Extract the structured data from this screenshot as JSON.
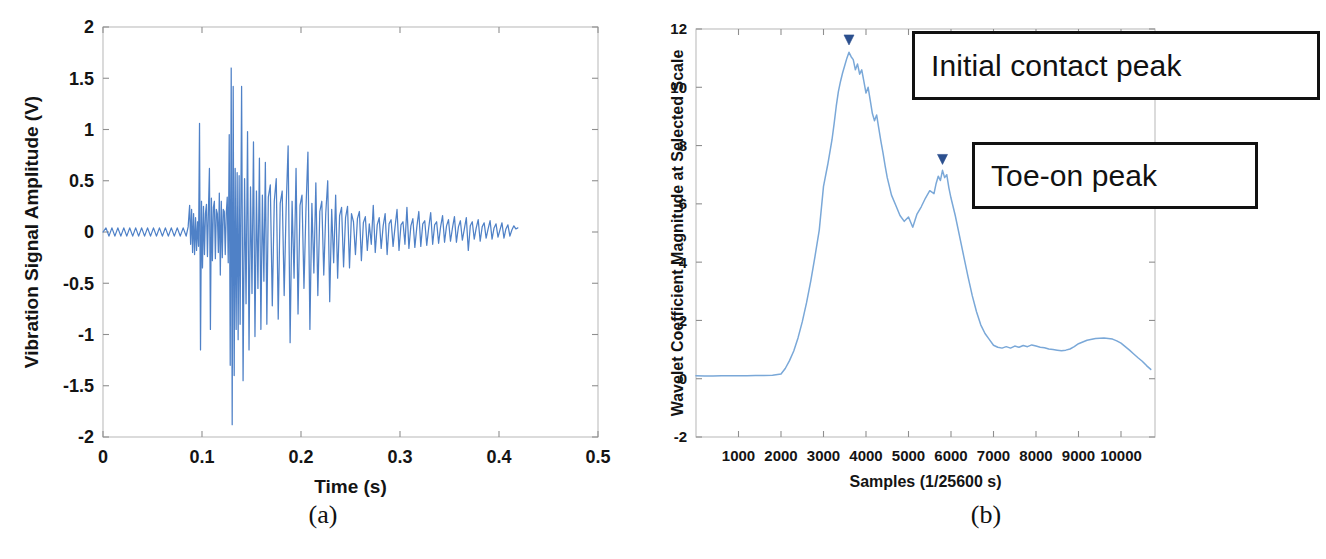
{
  "figure": {
    "panel_a_caption": "(a)",
    "panel_b_caption": "(b)"
  },
  "chart_data": [
    {
      "type": "line",
      "id": "vibration-signal",
      "title": "",
      "xlabel": "Time (s)",
      "ylabel": "Vibration Signal Amplitude (V)",
      "xlim": [
        0,
        0.5
      ],
      "ylim": [
        -2,
        2
      ],
      "xticks": [
        0,
        0.1,
        0.2,
        0.3,
        0.4,
        0.5
      ],
      "xticklabels": [
        "0",
        "0.1",
        "0.2",
        "0.3",
        "0.4",
        "0.5"
      ],
      "yticks": [
        -2,
        -1.5,
        -1,
        -0.5,
        0,
        0.5,
        1,
        1.5,
        2
      ],
      "yticklabels": [
        "-2",
        "-1.5",
        "-1",
        "-0.5",
        "0",
        "0.5",
        "1",
        "1.5",
        "2"
      ],
      "grid": false,
      "legend": null,
      "line_color": "#4f81c7",
      "x": [
        0.0,
        0.003,
        0.006,
        0.009,
        0.012,
        0.015,
        0.018,
        0.021,
        0.024,
        0.027,
        0.03,
        0.033,
        0.036,
        0.039,
        0.042,
        0.045,
        0.048,
        0.051,
        0.054,
        0.057,
        0.06,
        0.063,
        0.066,
        0.069,
        0.072,
        0.075,
        0.078,
        0.081,
        0.084,
        0.086,
        0.0875,
        0.0885,
        0.0895,
        0.0905,
        0.0915,
        0.0925,
        0.0935,
        0.0945,
        0.0955,
        0.0965,
        0.0975,
        0.0985,
        0.0995,
        0.1005,
        0.1015,
        0.1025,
        0.1035,
        0.1045,
        0.1055,
        0.1065,
        0.1075,
        0.1085,
        0.1095,
        0.1105,
        0.1115,
        0.1125,
        0.1135,
        0.1145,
        0.1155,
        0.1165,
        0.1175,
        0.1185,
        0.1195,
        0.1205,
        0.1215,
        0.1225,
        0.1235,
        0.1245,
        0.1255,
        0.1265,
        0.1275,
        0.1285,
        0.1295,
        0.1305,
        0.1315,
        0.1325,
        0.1335,
        0.1345,
        0.1355,
        0.1365,
        0.1375,
        0.1385,
        0.14,
        0.1415,
        0.143,
        0.1445,
        0.146,
        0.1475,
        0.149,
        0.1505,
        0.152,
        0.1535,
        0.155,
        0.1565,
        0.158,
        0.1595,
        0.161,
        0.1625,
        0.164,
        0.1655,
        0.167,
        0.169,
        0.171,
        0.173,
        0.175,
        0.177,
        0.179,
        0.181,
        0.183,
        0.185,
        0.187,
        0.189,
        0.191,
        0.193,
        0.195,
        0.197,
        0.199,
        0.201,
        0.203,
        0.205,
        0.207,
        0.209,
        0.211,
        0.213,
        0.215,
        0.217,
        0.219,
        0.221,
        0.223,
        0.225,
        0.227,
        0.229,
        0.231,
        0.233,
        0.235,
        0.237,
        0.239,
        0.241,
        0.243,
        0.245,
        0.247,
        0.249,
        0.251,
        0.253,
        0.255,
        0.257,
        0.259,
        0.261,
        0.263,
        0.265,
        0.267,
        0.269,
        0.271,
        0.273,
        0.275,
        0.277,
        0.279,
        0.281,
        0.283,
        0.285,
        0.287,
        0.289,
        0.291,
        0.293,
        0.295,
        0.297,
        0.299,
        0.301,
        0.303,
        0.305,
        0.307,
        0.309,
        0.311,
        0.313,
        0.315,
        0.317,
        0.319,
        0.321,
        0.323,
        0.325,
        0.327,
        0.329,
        0.331,
        0.333,
        0.335,
        0.337,
        0.339,
        0.341,
        0.343,
        0.345,
        0.347,
        0.349,
        0.351,
        0.353,
        0.355,
        0.357,
        0.359,
        0.361,
        0.363,
        0.365,
        0.367,
        0.369,
        0.371,
        0.373,
        0.375,
        0.377,
        0.379,
        0.381,
        0.383,
        0.385,
        0.387,
        0.389,
        0.391,
        0.393,
        0.395,
        0.397,
        0.399,
        0.401,
        0.403,
        0.405,
        0.407,
        0.409,
        0.411,
        0.413,
        0.415,
        0.417,
        0.419
      ],
      "y": [
        0.0,
        0.04,
        -0.04,
        0.04,
        -0.04,
        0.04,
        -0.04,
        0.04,
        -0.04,
        0.04,
        -0.04,
        0.04,
        -0.04,
        0.04,
        -0.04,
        0.04,
        -0.04,
        0.04,
        -0.04,
        0.04,
        -0.04,
        0.04,
        -0.04,
        0.04,
        -0.04,
        0.04,
        -0.04,
        0.04,
        -0.04,
        0.05,
        0.26,
        -0.12,
        0.22,
        -0.2,
        0.18,
        -0.22,
        0.14,
        -0.18,
        0.1,
        -0.14,
        1.06,
        -1.15,
        0.3,
        -0.35,
        0.25,
        -0.22,
        0.18,
        0.27,
        -0.24,
        0.21,
        0.62,
        -0.95,
        0.33,
        -0.28,
        0.24,
        0.3,
        -0.26,
        0.22,
        0.18,
        -0.2,
        0.38,
        -0.42,
        0.3,
        -0.25,
        0.22,
        0.2,
        -0.22,
        0.18,
        0.34,
        -0.3,
        0.95,
        -1.3,
        1.6,
        -1.88,
        1.42,
        -1.4,
        0.62,
        -0.95,
        0.58,
        -1.05,
        0.55,
        -0.9,
        1.42,
        -1.45,
        0.52,
        -0.7,
        0.98,
        -1.15,
        0.44,
        -0.6,
        0.88,
        -1.02,
        0.4,
        -0.55,
        0.72,
        -0.95,
        0.36,
        -0.48,
        0.68,
        -0.9,
        0.34,
        0.46,
        -0.72,
        0.3,
        0.52,
        -0.85,
        0.28,
        0.4,
        -0.62,
        0.24,
        0.84,
        -1.08,
        0.3,
        -0.45,
        0.62,
        -0.8,
        0.26,
        0.36,
        -0.55,
        0.22,
        0.78,
        -0.95,
        0.28,
        -0.4,
        0.48,
        -0.62,
        0.2,
        0.3,
        -0.42,
        0.18,
        0.5,
        -0.68,
        0.22,
        -0.3,
        0.36,
        -0.45,
        0.16,
        0.24,
        -0.34,
        0.14,
        0.25,
        -0.35,
        0.18,
        0.1,
        -0.22,
        0.13,
        0.2,
        -0.28,
        0.09,
        0.15,
        -0.18,
        0.08,
        -0.12,
        0.26,
        -0.2,
        0.07,
        0.14,
        -0.16,
        0.06,
        0.18,
        -0.22,
        0.08,
        0.12,
        -0.14,
        0.05,
        0.22,
        -0.18,
        0.07,
        0.1,
        -0.12,
        0.24,
        -0.16,
        0.06,
        0.13,
        -0.15,
        0.05,
        0.2,
        -0.14,
        0.08,
        0.11,
        -0.13,
        0.04,
        0.19,
        -0.12,
        0.07,
        0.1,
        -0.11,
        0.05,
        0.16,
        -0.1,
        0.06,
        0.12,
        -0.09,
        0.04,
        0.15,
        -0.1,
        0.05,
        0.11,
        -0.08,
        0.03,
        0.14,
        -0.18,
        0.06,
        0.1,
        -0.07,
        0.04,
        0.12,
        -0.09,
        0.05,
        0.09,
        -0.06,
        0.03,
        0.11,
        -0.07,
        0.04,
        0.08,
        -0.05,
        0.02,
        0.09,
        -0.06,
        0.03,
        0.07,
        -0.04,
        0.02,
        0.06,
        0.03,
        0.04
      ]
    },
    {
      "type": "line",
      "id": "wavelet-coefficient-magnitude",
      "title": "",
      "xlabel": "Samples (1/25600 s)",
      "ylabel": "Wavelet Coefficient Magnitude at Selected Scale",
      "xlim": [
        0,
        10800
      ],
      "ylim": [
        -2,
        12
      ],
      "xticks": [
        1000,
        2000,
        3000,
        4000,
        5000,
        6000,
        7000,
        8000,
        9000,
        10000
      ],
      "xticklabels": [
        "1000",
        "2000",
        "3000",
        "4000",
        "5000",
        "6000",
        "7000",
        "8000",
        "9000",
        "10000"
      ],
      "yticks": [
        -2,
        0,
        2,
        4,
        6,
        8,
        10,
        12
      ],
      "yticklabels": [
        "-2",
        "0",
        "2",
        "4",
        "6",
        "8",
        "10",
        "12"
      ],
      "grid": false,
      "legend": null,
      "line_color": "#7aa8d8",
      "x": [
        0,
        200,
        400,
        600,
        800,
        1000,
        1200,
        1400,
        1600,
        1800,
        2000,
        2100,
        2200,
        2300,
        2400,
        2500,
        2600,
        2700,
        2800,
        2900,
        3000,
        3100,
        3200,
        3250,
        3300,
        3350,
        3400,
        3450,
        3500,
        3550,
        3600,
        3650,
        3700,
        3750,
        3800,
        3850,
        3900,
        3950,
        4000,
        4050,
        4100,
        4150,
        4200,
        4250,
        4300,
        4350,
        4400,
        4450,
        4500,
        4550,
        4600,
        4700,
        4800,
        4900,
        5000,
        5100,
        5200,
        5300,
        5400,
        5500,
        5600,
        5650,
        5700,
        5750,
        5800,
        5850,
        5900,
        5950,
        6000,
        6100,
        6200,
        6300,
        6400,
        6500,
        6600,
        6700,
        6800,
        6900,
        7000,
        7100,
        7200,
        7300,
        7400,
        7500,
        7600,
        7700,
        7800,
        7900,
        8000,
        8100,
        8200,
        8300,
        8400,
        8500,
        8600,
        8700,
        8800,
        8900,
        9000,
        9200,
        9400,
        9600,
        9800,
        9900,
        10000,
        10100,
        10200,
        10300,
        10400,
        10500,
        10600,
        10700
      ],
      "y": [
        0.1,
        0.09,
        0.09,
        0.1,
        0.1,
        0.1,
        0.1,
        0.11,
        0.11,
        0.12,
        0.16,
        0.35,
        0.62,
        0.95,
        1.4,
        1.95,
        2.6,
        3.35,
        4.2,
        5.1,
        6.6,
        7.35,
        8.2,
        8.75,
        9.35,
        9.85,
        10.2,
        10.5,
        10.75,
        11.0,
        11.2,
        11.05,
        10.95,
        10.6,
        10.8,
        10.45,
        10.6,
        10.2,
        9.8,
        10.0,
        9.55,
        9.1,
        8.85,
        9.05,
        8.6,
        8.15,
        7.75,
        7.3,
        6.9,
        6.6,
        6.3,
        5.95,
        5.6,
        5.4,
        5.55,
        5.2,
        5.65,
        5.9,
        6.2,
        6.45,
        6.35,
        6.7,
        6.95,
        6.8,
        7.15,
        6.9,
        7.0,
        6.55,
        6.2,
        5.6,
        4.9,
        4.2,
        3.5,
        2.85,
        2.3,
        1.85,
        1.55,
        1.35,
        1.15,
        1.08,
        1.05,
        1.1,
        1.05,
        1.12,
        1.08,
        1.14,
        1.1,
        1.16,
        1.12,
        1.08,
        1.06,
        1.02,
        1.0,
        0.98,
        0.96,
        0.98,
        1.02,
        1.1,
        1.2,
        1.32,
        1.38,
        1.4,
        1.36,
        1.3,
        1.22,
        1.1,
        0.98,
        0.85,
        0.72,
        0.6,
        0.45,
        0.32
      ],
      "annotations": [
        {
          "name": "initial-contact-peak",
          "label": "Initial contact peak",
          "marker_x": 3600,
          "marker_y": 11.35,
          "marker_shape": "triangle-down"
        },
        {
          "name": "toe-on-peak",
          "label": "Toe-on peak",
          "marker_x": 5800,
          "marker_y": 7.25,
          "marker_shape": "triangle-down"
        }
      ]
    }
  ]
}
